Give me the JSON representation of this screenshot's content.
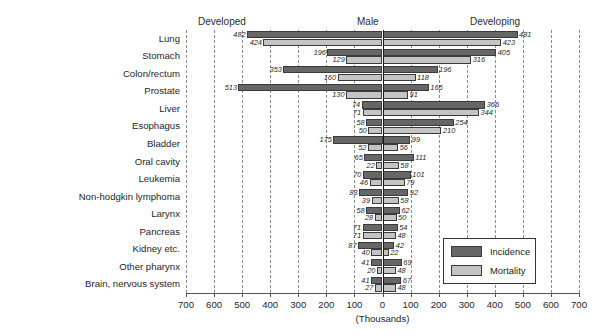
{
  "headers": {
    "developed": "Developed",
    "male": "Male",
    "developing": "Developing"
  },
  "legend": {
    "incidence": "Incidence",
    "mortality": "Mortality",
    "incidence_color": "#666666",
    "mortality_color": "#c4c4c4",
    "position": "bottom-right-inside"
  },
  "chart_data": {
    "type": "bar",
    "orientation": "horizontal-diverging",
    "title": "",
    "subtitle": "",
    "xlabel": "(Thousands)",
    "ylabel": "",
    "grid": true,
    "xlim": [
      -700,
      700
    ],
    "xticks": [
      -700,
      -600,
      -500,
      -400,
      -300,
      -200,
      -100,
      0,
      100,
      200,
      300,
      400,
      500,
      600,
      700
    ],
    "xticklabels": [
      "700",
      "600",
      "500",
      "400",
      "300",
      "200",
      "100",
      "0",
      "100",
      "200",
      "300",
      "400",
      "500",
      "600",
      "700"
    ],
    "left_side_label": "Developed",
    "right_side_label": "Developing",
    "center_label": "Male",
    "categories": [
      "Lung",
      "Stomach",
      "Colon/rectum",
      "Prostate",
      "Liver",
      "Esophagus",
      "Bladder",
      "Oral cavity",
      "Leukemia",
      "Non-hodgkin lymphoma",
      "Larynx",
      "Pancreas",
      "Kidney etc.",
      "Other pharynx",
      "Brain, nervous system"
    ],
    "series": [
      {
        "name": "Incidence",
        "developed": [
          482,
          196,
          353,
          513,
          74,
          58,
          175,
          65,
          70,
          83,
          58,
          71,
          87,
          41,
          41
        ],
        "developing": [
          481,
          405,
          196,
          165,
          366,
          254,
          99,
          111,
          101,
          92,
          62,
          54,
          42,
          69,
          67
        ]
      },
      {
        "name": "Mortality",
        "developed": [
          424,
          129,
          160,
          130,
          71,
          50,
          52,
          22,
          46,
          39,
          28,
          71,
          40,
          20,
          27
        ],
        "developing": [
          423,
          316,
          118,
          91,
          344,
          210,
          56,
          58,
          79,
          58,
          50,
          48,
          22,
          48,
          48
        ]
      }
    ]
  }
}
